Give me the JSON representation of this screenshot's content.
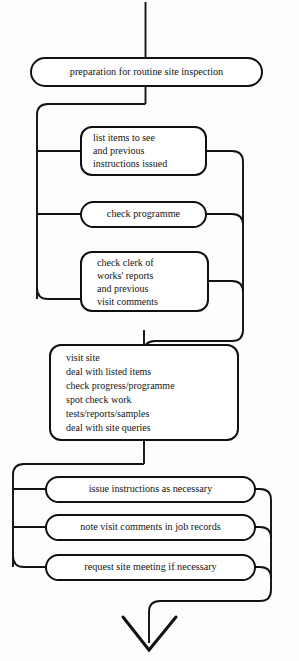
{
  "diagram": {
    "orientation": "top-to-bottom",
    "line_color": "#121212",
    "box_fill": "#ffffff",
    "background": "#fdfdfd"
  },
  "nodes": {
    "entry": {
      "name": "entry-connector",
      "label": ""
    },
    "preparation": {
      "label": "preparation for routine site inspection",
      "lines": [
        "preparation for routine site inspection"
      ],
      "align": "center"
    },
    "list_items": {
      "label": "list items to see and previous instructions issued",
      "lines": [
        "list items to see",
        "and previous",
        "instructions issued"
      ],
      "align": "left"
    },
    "check_programme": {
      "label": "check programme",
      "lines": [
        "check programme"
      ],
      "align": "center"
    },
    "check_clerk": {
      "label": "check clerk of works' reports and previous visit comments",
      "lines": [
        "check clerk of",
        "works' reports",
        "and previous",
        "visit comments"
      ],
      "align": "left"
    },
    "visit_site": {
      "label": "visit site, deal with listed items, check progress/programme, spot check work, tests/reports/samples, deal with site queries",
      "lines": [
        "visit site",
        "deal with listed items",
        "check progress/programme",
        "spot check work",
        "tests/reports/samples",
        "deal with site queries"
      ],
      "align": "left"
    },
    "issue_instructions": {
      "label": "issue instructions as necessary",
      "lines": [
        "issue instructions as necessary"
      ],
      "align": "center"
    },
    "note_visit": {
      "label": "note visit comments in job records",
      "lines": [
        "note visit comments in job records"
      ],
      "align": "center"
    },
    "request_meeting": {
      "label": "request site meeting if necessary",
      "lines": [
        "request site meeting if necessary"
      ],
      "align": "center"
    },
    "exit": {
      "name": "exit-arrow",
      "label": ""
    }
  },
  "icons": {
    "down_arrow": "arrow-down-icon"
  }
}
